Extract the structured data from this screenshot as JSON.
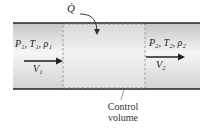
{
  "diagram": {
    "heat_label": "Q̇",
    "inlet": {
      "state_label": "P₁, T₁, ρ₁",
      "velocity_label": "V₁"
    },
    "outlet": {
      "state_label": "P₂, T₂, ρ₂",
      "velocity_label": "V₂"
    },
    "control_volume_caption_line1": "Control",
    "control_volume_caption_line2": "volume",
    "colors": {
      "pipe_wall": "#222222",
      "pipe_fill_edge": "#c8c8c8",
      "pipe_fill_center": "#f4f4f4",
      "dash": "#888888",
      "arrow": "#222222"
    }
  }
}
